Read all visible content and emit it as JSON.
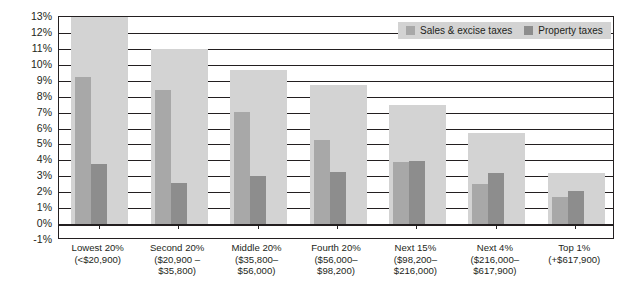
{
  "chart_data": {
    "type": "bar",
    "title": "",
    "subtitle": "",
    "xlabel": "",
    "ylabel": "",
    "ylim": [
      -1,
      13
    ],
    "ytick_values": [
      -1,
      0,
      1,
      2,
      3,
      4,
      5,
      6,
      7,
      8,
      9,
      10,
      11,
      12,
      13
    ],
    "ytick_labels": [
      "-1%",
      "0%",
      "1%",
      "2%",
      "3%",
      "4%",
      "5%",
      "6%",
      "7%",
      "8%",
      "9%",
      "10%",
      "11%",
      "12%",
      "13%"
    ],
    "grid": true,
    "legend_position": "top-right",
    "categories": [
      "Lowest 20%",
      "Second 20%",
      "Middle 20%",
      "Fourth 20%",
      "Next 15%",
      "Next 4%",
      "Top 1%"
    ],
    "category_sublabels": [
      [
        "(<$20,900)",
        ""
      ],
      [
        "($20,900 –",
        "$35,800)"
      ],
      [
        "($35,800–",
        "$56,000)"
      ],
      [
        "($56,000–",
        "$98,200)"
      ],
      [
        "($98,200–",
        "$216,000)"
      ],
      [
        "($216,000–",
        "$617,900)"
      ],
      [
        "(+$617,900)",
        ""
      ]
    ],
    "series": [
      {
        "name": "Total taxes",
        "in_legend": false,
        "color": "#d3d3d3",
        "values": [
          13.4,
          11.0,
          9.65,
          8.7,
          7.45,
          5.7,
          3.2
        ]
      },
      {
        "name": "Sales & excise taxes",
        "in_legend": true,
        "color": "#a8a8a8",
        "values": [
          9.25,
          8.4,
          7.05,
          5.3,
          3.9,
          2.5,
          1.7
        ]
      },
      {
        "name": "Property taxes",
        "in_legend": true,
        "color": "#8d8d8d",
        "values": [
          3.8,
          2.6,
          3.0,
          3.3,
          3.95,
          3.2,
          2.1
        ]
      }
    ]
  },
  "legend": {
    "items": [
      {
        "label": "Sales & excise taxes",
        "color": "#a8a8a8"
      },
      {
        "label": "Property taxes",
        "color": "#8d8d8d"
      }
    ],
    "background": "#d3d3d3"
  },
  "colors": {
    "axis": "#231f20",
    "plot_background": "#ffffff",
    "total_taxes": "#d3d3d3",
    "sales_excise": "#a8a8a8",
    "property": "#8d8d8d"
  }
}
